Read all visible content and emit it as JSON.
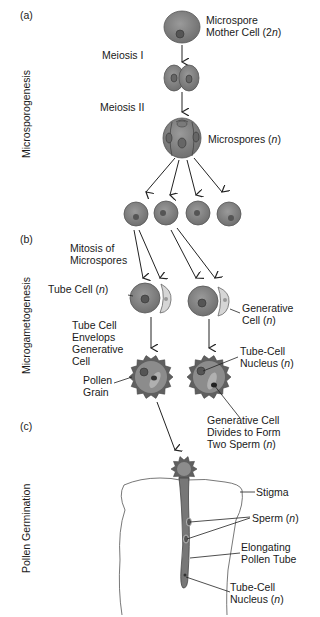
{
  "sections": {
    "a": "(a)",
    "b": "(b)",
    "c": "(c)"
  },
  "side_labels": {
    "microsporogenesis": "Microsporogenesis",
    "microgametogenesis": "Microgametogenesis",
    "pollen_germination": "Pollen Germination"
  },
  "labels": {
    "mother_cell": "Microspore\nMother Cell (2n)",
    "meiosis1": "Meiosis I",
    "meiosis2": "Meiosis II",
    "microspores": "Microspores (n)",
    "mitosis": "Mitosis of\nMicrospores",
    "tube_cell": "Tube Cell (n)",
    "generative_cell": "Generative\nCell (n)",
    "envelops": "Tube Cell\nEnvelops\nGenerative\nCell",
    "tube_cell_nucleus": "Tube-Cell\nNucleus (n)",
    "pollen_grain": "Pollen\nGrain",
    "divides": "Generative Cell\nDivides to Form\nTwo Sperm (n)",
    "stigma": "Stigma",
    "sperm": "Sperm (n)",
    "elongating": "Elongating\nPollen Tube",
    "tube_cell_nucleus2": "Tube-Cell\nNucleus (n)"
  },
  "colors": {
    "cell": "#8a8a8a",
    "cell_dark": "#5e5e5e",
    "generative": "#d6d6d6",
    "line": "#222222"
  }
}
